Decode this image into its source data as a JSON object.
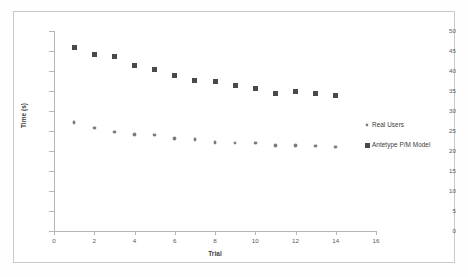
{
  "chart_data": {
    "type": "scatter",
    "title": "",
    "xlabel": "Trial",
    "ylabel": "Time (s)",
    "xlim": [
      0,
      16
    ],
    "ylim": [
      0,
      50
    ],
    "xticks": [
      0,
      2,
      4,
      6,
      8,
      10,
      12,
      14,
      16
    ],
    "yticks": [
      0,
      5,
      10,
      15,
      20,
      25,
      30,
      35,
      40,
      45,
      50
    ],
    "grid": false,
    "legend_position": "right",
    "x": [
      1,
      2,
      3,
      4,
      5,
      6,
      7,
      8,
      9,
      10,
      11,
      12,
      13,
      14
    ],
    "series": [
      {
        "name": "Real Users",
        "marker": "diamond",
        "color": "#7a7a7a",
        "values": [
          27.1,
          25.7,
          24.8,
          24.1,
          24.0,
          23.1,
          22.9,
          22.1,
          22.0,
          22.0,
          21.4,
          21.4,
          21.2,
          21.0
        ]
      },
      {
        "name": "Antetype P/M Model",
        "marker": "square",
        "color": "#494949",
        "values": [
          45.8,
          44.2,
          43.7,
          41.3,
          40.3,
          38.8,
          37.6,
          37.3,
          36.4,
          35.6,
          34.4,
          34.9,
          34.5,
          33.9
        ]
      }
    ]
  },
  "axes": {
    "x_title": "Trial",
    "y_title": "Time (s)",
    "x_tick_labels": [
      "0",
      "2",
      "4",
      "6",
      "8",
      "10",
      "12",
      "14",
      "16"
    ],
    "y_tick_labels": [
      "0",
      "5",
      "10",
      "15",
      "20",
      "25",
      "30",
      "35",
      "40",
      "45",
      "50"
    ]
  },
  "legend": {
    "entries": [
      {
        "label": "Real Users",
        "marker": "diamond-marker-icon"
      },
      {
        "label": "Antetype P/M Model",
        "marker": "square-marker-icon"
      }
    ]
  },
  "colors": {
    "series_real_users": "#7a7a7a",
    "series_model": "#494949",
    "axis": "#b6b6b6",
    "text": "#3c3c3e",
    "frame": "#c9c9c9"
  }
}
